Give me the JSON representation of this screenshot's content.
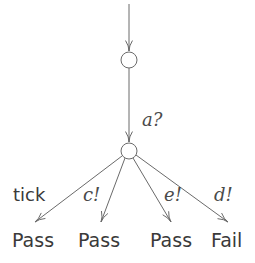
{
  "diagram": {
    "type": "test-case-tree",
    "states": [
      {
        "id": "s0",
        "cx": 129,
        "cy": 60,
        "r": 8
      },
      {
        "id": "s1",
        "cx": 129,
        "cy": 151,
        "r": 8
      }
    ],
    "initial_arrow": {
      "x": 129,
      "y1": 4,
      "y2": 51
    },
    "edges": [
      {
        "id": "e-a",
        "from": "s0",
        "to": "s1",
        "label": "a?",
        "style": "math",
        "x1": 129,
        "y1": 68,
        "x2": 129,
        "y2": 142,
        "label_x": 142,
        "label_y": 126
      },
      {
        "id": "e-tick",
        "from": "s1",
        "to": "v0",
        "label": "tick",
        "style": "sans",
        "x1": 122,
        "y1": 156,
        "x2": 35,
        "y2": 222,
        "label_x": 13,
        "label_y": 201
      },
      {
        "id": "e-c",
        "from": "s1",
        "to": "v1",
        "label": "c!",
        "style": "math",
        "x1": 125,
        "y1": 158,
        "x2": 101,
        "y2": 222,
        "label_x": 83,
        "label_y": 201
      },
      {
        "id": "e-e",
        "from": "s1",
        "to": "v2",
        "label": "e!",
        "style": "math",
        "x1": 133,
        "y1": 158,
        "x2": 171,
        "y2": 222,
        "label_x": 164,
        "label_y": 201
      },
      {
        "id": "e-d",
        "from": "s1",
        "to": "v3",
        "label": "d!",
        "style": "math",
        "x1": 136,
        "y1": 155,
        "x2": 228,
        "y2": 222,
        "label_x": 214,
        "label_y": 201
      }
    ],
    "verdicts": [
      {
        "id": "v0",
        "label": "Pass",
        "x": 12,
        "y": 247
      },
      {
        "id": "v1",
        "label": "Pass",
        "x": 78,
        "y": 247
      },
      {
        "id": "v2",
        "label": "Pass",
        "x": 150,
        "y": 247
      },
      {
        "id": "v3",
        "label": "Fail",
        "x": 211,
        "y": 247
      }
    ],
    "colors": {
      "stroke": "#6a6a6a",
      "text": "#3a3a3a",
      "background": "#ffffff"
    }
  }
}
